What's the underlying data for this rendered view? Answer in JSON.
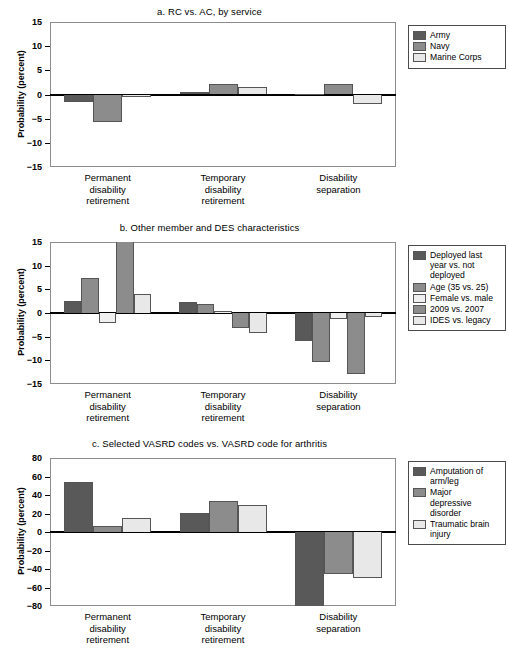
{
  "figure": {
    "ylabel": "Probability (percent)",
    "categories": [
      "Permanent\ndisability\nretirement",
      "Temporary\ndisability\nretirement",
      "Disability\nseparation"
    ]
  },
  "colors": {
    "dark": "#595959",
    "medium": "#8c8c8c",
    "light": "#e8e8e8",
    "frame": "#8d8d8d",
    "zero": "#000000",
    "legend_border": "#4a4a4a"
  },
  "chart_data": [
    {
      "type": "bar",
      "title": "a. RC vs. AC, by service",
      "xlabel": "",
      "ylabel": "Probability (percent)",
      "ylim": [
        -15,
        15
      ],
      "yticks": [
        15,
        10,
        5,
        0,
        -5,
        -10,
        -15
      ],
      "ytick_labels": [
        "15",
        "10",
        "5",
        "0",
        "−5",
        "−10",
        "−15"
      ],
      "grid": false,
      "legend_position": "right",
      "categories": [
        "Permanent disability retirement",
        "Temporary disability retirement",
        "Disability separation"
      ],
      "series": [
        {
          "name": "Army",
          "color": "#595959",
          "values": [
            -1.5,
            0.5,
            0.2
          ]
        },
        {
          "name": "Navy",
          "color": "#8c8c8c",
          "values": [
            -5.7,
            2.2,
            2.2
          ]
        },
        {
          "name": "Marine Corps",
          "color": "#e8e8e8",
          "values": [
            -0.6,
            1.6,
            -2.0
          ]
        }
      ]
    },
    {
      "type": "bar",
      "title": "b. Other member and DES characteristics",
      "xlabel": "",
      "ylabel": "Probability (percent)",
      "ylim": [
        -15,
        15
      ],
      "yticks": [
        15,
        10,
        5,
        0,
        -5,
        -10,
        -15
      ],
      "ytick_labels": [
        "15",
        "10",
        "5",
        "0",
        "−5",
        "−10",
        "−15"
      ],
      "grid": false,
      "legend_position": "right",
      "annotations": [
        "'2009 vs. 2007' bar for permanent disability retirement is clipped at the top of the 15-percent axis"
      ],
      "categories": [
        "Permanent disability retirement",
        "Temporary disability retirement",
        "Disability separation"
      ],
      "series": [
        {
          "name": "Deployed last\nyear vs. not\ndeployed",
          "color": "#595959",
          "values": [
            2.6,
            2.4,
            -5.9
          ]
        },
        {
          "name": "Age (35 vs. 25)",
          "color": "#8c8c8c",
          "values": [
            7.4,
            1.9,
            -10.4
          ]
        },
        {
          "name": "Female vs. male",
          "color": "#f0f0f0",
          "values": [
            -2.1,
            0.4,
            -1.2
          ]
        },
        {
          "name": "2009 vs. 2007",
          "color": "#8c8c8c",
          "values": [
            15.0,
            -3.1,
            -12.9
          ]
        },
        {
          "name": "IDES vs. legacy",
          "color": "#e8e8e8",
          "values": [
            4.1,
            -4.3,
            -0.8
          ]
        }
      ]
    },
    {
      "type": "bar",
      "title": "c. Selected VASRD codes vs. VASRD code for arthritis",
      "xlabel": "",
      "ylabel": "Probability (percent)",
      "ylim": [
        -80,
        80
      ],
      "yticks": [
        80,
        60,
        40,
        20,
        0,
        -20,
        -40,
        -60,
        -80
      ],
      "ytick_labels": [
        "80",
        "60",
        "40",
        "20",
        "0",
        "−20",
        "−40",
        "−60",
        "−80"
      ],
      "grid": false,
      "legend_position": "right",
      "categories": [
        "Permanent disability retirement",
        "Temporary disability retirement",
        "Disability separation"
      ],
      "series": [
        {
          "name": "Amputation of\narm/leg",
          "color": "#595959",
          "values": [
            54,
            21,
            -80
          ]
        },
        {
          "name": "Major\ndepressive\ndisorder",
          "color": "#8c8c8c",
          "values": [
            6,
            34,
            -45
          ]
        },
        {
          "name": "Traumatic brain\ninjury",
          "color": "#e8e8e8",
          "values": [
            15,
            29,
            -50
          ]
        }
      ]
    }
  ]
}
